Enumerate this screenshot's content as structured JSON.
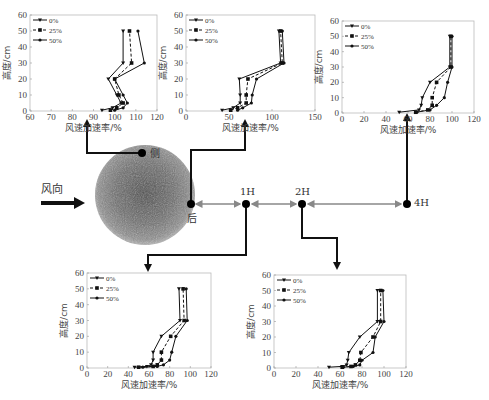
{
  "diagram": {
    "wind_label": "风向",
    "nodes": [
      {
        "id": "side",
        "label": "侧"
      },
      {
        "id": "behind",
        "label": "后"
      },
      {
        "id": "1H",
        "label": "1H"
      },
      {
        "id": "2H",
        "label": "2H"
      },
      {
        "id": "4H",
        "label": "4H"
      }
    ]
  },
  "chart_data": [
    {
      "id": "side",
      "type": "line",
      "position": "侧",
      "xlabel": "风速加速率/%",
      "ylabel": "高度/cm",
      "xlim": [
        60,
        120
      ],
      "xticks": [
        60,
        70,
        80,
        90,
        100,
        110,
        120
      ],
      "ylim": [
        0,
        60
      ],
      "yticks": [
        0,
        10,
        20,
        30,
        40,
        50,
        60
      ],
      "legend": [
        "0%",
        "25%",
        "50%"
      ],
      "series": [
        {
          "name": "0%",
          "style": "solid",
          "points": [
            [
              94,
              0.5
            ],
            [
              99,
              2
            ],
            [
              103,
              5
            ],
            [
              101,
              10
            ],
            [
              97,
              20
            ],
            [
              104,
              30
            ],
            [
              104,
              50
            ]
          ]
        },
        {
          "name": "25%",
          "style": "dashed",
          "points": [
            [
              98,
              0.5
            ],
            [
              101,
              2
            ],
            [
              104,
              5
            ],
            [
              102,
              10
            ],
            [
              100,
              20
            ],
            [
              108,
              30
            ],
            [
              107,
              50
            ]
          ]
        },
        {
          "name": "50%",
          "style": "solid",
          "points": [
            [
              100,
              0.5
            ],
            [
              104,
              2
            ],
            [
              106,
              5
            ],
            [
              104,
              10
            ],
            [
              100,
              20
            ],
            [
              114,
              30
            ],
            [
              111,
              50
            ]
          ]
        }
      ]
    },
    {
      "id": "behind",
      "type": "line",
      "position": "后",
      "xlabel": "风速加速率/%",
      "ylabel": "高度/cm",
      "xlim": [
        0,
        150
      ],
      "xticks": [
        0,
        50,
        100,
        150
      ],
      "ylim": [
        0,
        60
      ],
      "yticks": [
        0,
        10,
        20,
        30,
        40,
        50,
        60
      ],
      "legend": [
        "0%",
        "25%",
        "50%"
      ],
      "series": [
        {
          "name": "0%",
          "style": "solid",
          "points": [
            [
              42,
              0.5
            ],
            [
              55,
              2
            ],
            [
              63,
              5
            ],
            [
              63,
              10
            ],
            [
              62,
              20
            ],
            [
              110,
              30
            ],
            [
              108,
              50
            ]
          ]
        },
        {
          "name": "25%",
          "style": "dashed",
          "points": [
            [
              52,
              0.5
            ],
            [
              60,
              2
            ],
            [
              70,
              5
            ],
            [
              70,
              10
            ],
            [
              72,
              20
            ],
            [
              112,
              30
            ],
            [
              110,
              50
            ]
          ]
        },
        {
          "name": "50%",
          "style": "solid",
          "points": [
            [
              60,
              0.5
            ],
            [
              66,
              2
            ],
            [
              76,
              5
            ],
            [
              77,
              10
            ],
            [
              82,
              20
            ],
            [
              114,
              30
            ],
            [
              112,
              50
            ]
          ]
        }
      ]
    },
    {
      "id": "4H",
      "type": "line",
      "position": "4H",
      "xlabel": "风速加速率/%",
      "ylabel": "高度/cm",
      "xlim": [
        0,
        120
      ],
      "xticks": [
        0,
        20,
        40,
        60,
        80,
        100,
        120
      ],
      "ylim": [
        0,
        60
      ],
      "yticks": [
        0,
        10,
        20,
        30,
        40,
        50,
        60
      ],
      "legend": [
        "0%",
        "25%",
        "50%"
      ],
      "series": [
        {
          "name": "0%",
          "style": "solid",
          "points": [
            [
              52,
              0.5
            ],
            [
              70,
              2
            ],
            [
              72,
              5
            ],
            [
              73,
              10
            ],
            [
              80,
              20
            ],
            [
              98,
              30
            ],
            [
              98,
              50
            ]
          ]
        },
        {
          "name": "25%",
          "style": "dashed",
          "points": [
            [
              67,
              0.5
            ],
            [
              78,
              2
            ],
            [
              82,
              5
            ],
            [
              82,
              10
            ],
            [
              86,
              20
            ],
            [
              99,
              30
            ],
            [
              99,
              50
            ]
          ]
        },
        {
          "name": "50%",
          "style": "solid",
          "points": [
            [
              68,
              0.5
            ],
            [
              80,
              2
            ],
            [
              86,
              5
            ],
            [
              93,
              10
            ],
            [
              96,
              20
            ],
            [
              100,
              30
            ],
            [
              100,
              50
            ]
          ]
        }
      ]
    },
    {
      "id": "1H",
      "type": "line",
      "position": "1H",
      "xlabel": "风速加速率/%",
      "ylabel": "高度/cm",
      "xlim": [
        0,
        120
      ],
      "xticks": [
        0,
        20,
        40,
        60,
        80,
        100,
        120
      ],
      "ylim": [
        0,
        60
      ],
      "yticks": [
        0,
        10,
        20,
        30,
        40,
        50,
        60
      ],
      "legend": [
        "0%",
        "25%",
        "50%"
      ],
      "series": [
        {
          "name": "0%",
          "style": "solid",
          "points": [
            [
              46,
              0.5
            ],
            [
              58,
              1
            ],
            [
              62,
              2
            ],
            [
              64,
              5
            ],
            [
              64,
              10
            ],
            [
              72,
              20
            ],
            [
              90,
              30
            ],
            [
              89,
              50
            ]
          ]
        },
        {
          "name": "25%",
          "style": "dashed",
          "points": [
            [
              50,
              0.5
            ],
            [
              64,
              1
            ],
            [
              68,
              2
            ],
            [
              72,
              5
            ],
            [
              72,
              10
            ],
            [
              81,
              20
            ],
            [
              94,
              30
            ],
            [
              93,
              50
            ]
          ]
        },
        {
          "name": "50%",
          "style": "solid",
          "points": [
            [
              54,
              0.5
            ],
            [
              68,
              1
            ],
            [
              74,
              2
            ],
            [
              80,
              5
            ],
            [
              82,
              10
            ],
            [
              86,
              20
            ],
            [
              97,
              30
            ],
            [
              96,
              50
            ]
          ]
        }
      ]
    },
    {
      "id": "2H",
      "type": "line",
      "position": "2H",
      "xlabel": "风速加速率/%",
      "ylabel": "高度/cm",
      "xlim": [
        0,
        120
      ],
      "xticks": [
        0,
        20,
        40,
        60,
        80,
        100,
        120
      ],
      "ylim": [
        0,
        60
      ],
      "yticks": [
        0,
        10,
        20,
        30,
        40,
        50,
        60
      ],
      "legend": [
        "0%",
        "25%",
        "50%"
      ],
      "series": [
        {
          "name": "0%",
          "style": "solid",
          "points": [
            [
              50,
              0.5
            ],
            [
              62,
              1
            ],
            [
              66,
              2
            ],
            [
              67,
              5
            ],
            [
              68,
              10
            ],
            [
              78,
              20
            ],
            [
              94,
              30
            ],
            [
              94,
              50
            ]
          ]
        },
        {
          "name": "25%",
          "style": "dashed",
          "points": [
            [
              62,
              0.5
            ],
            [
              70,
              1
            ],
            [
              74,
              2
            ],
            [
              78,
              5
            ],
            [
              79,
              10
            ],
            [
              90,
              20
            ],
            [
              97,
              30
            ],
            [
              97,
              50
            ]
          ]
        },
        {
          "name": "50%",
          "style": "solid",
          "points": [
            [
              63,
              0.5
            ],
            [
              72,
              1
            ],
            [
              78,
              2
            ],
            [
              80,
              5
            ],
            [
              90,
              10
            ],
            [
              92,
              20
            ],
            [
              100,
              30
            ],
            [
              99,
              50
            ]
          ]
        }
      ]
    }
  ],
  "layout": {
    "charts": {
      "side": {
        "left": 30,
        "top": 15,
        "right": 157,
        "bottom": 111
      },
      "behind": {
        "left": 186,
        "top": 15,
        "right": 315,
        "bottom": 111
      },
      "4H": {
        "left": 342,
        "top": 21,
        "right": 474,
        "bottom": 113
      },
      "1H": {
        "left": 87,
        "top": 273,
        "right": 211,
        "bottom": 368
      },
      "2H": {
        "left": 274,
        "top": 275,
        "right": 406,
        "bottom": 368
      }
    }
  }
}
